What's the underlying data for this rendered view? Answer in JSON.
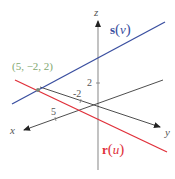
{
  "diagram": {
    "type": "3d-lines-intersection",
    "axes": {
      "x": {
        "label": "x",
        "tick_label": "5"
      },
      "y": {
        "label": "y",
        "tick_label": "-2"
      },
      "z": {
        "label": "z",
        "tick_label": "2"
      }
    },
    "lines": [
      {
        "name": "s",
        "label": "s(v)",
        "label_bold": "s",
        "label_paren_open": "(",
        "label_var": "v",
        "label_paren_close": ")",
        "color": "#3a4fa0"
      },
      {
        "name": "r",
        "label": "r(u)",
        "label_bold": "r",
        "label_paren_open": "(",
        "label_var": "u",
        "label_paren_close": ")",
        "color": "#e0303a"
      }
    ],
    "intersection": {
      "label": "(5, −2, 2)",
      "color": "#7fa870"
    },
    "colors": {
      "axis": "#3a3a3a",
      "z_axis": "#9a9a9a",
      "line_s": "#3a4fa0",
      "line_r": "#e0303a",
      "point_label": "#7fa870"
    }
  }
}
